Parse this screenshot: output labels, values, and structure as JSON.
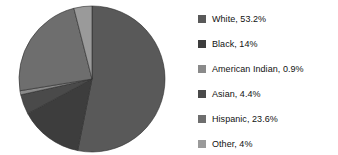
{
  "chart_data": {
    "type": "pie",
    "title": "",
    "subtitle": "",
    "xlabel": "",
    "ylabel": "",
    "grid": false,
    "legend_position": "right",
    "start_angle_deg": 0,
    "direction": "clockwise",
    "labels": [
      "White",
      "Black",
      "American Indian",
      "Asian",
      "Hispanic",
      "Other"
    ],
    "values": [
      53.2,
      14,
      0.9,
      4.4,
      23.6,
      4
    ],
    "value_text": [
      "53.2%",
      "14%",
      "0.9%",
      "4.4%",
      "23.6%",
      "4%"
    ],
    "colors": [
      "#595959",
      "#3d3d3d",
      "#8a8a8a",
      "#4a4a4a",
      "#6e6e6e",
      "#9a9a9a"
    ],
    "slice_order_clockwise": [
      "White",
      "Black",
      "Asian",
      "American Indian",
      "Hispanic",
      "Other"
    ]
  },
  "legend": {
    "items": [
      {
        "label": "White, 53.2%",
        "color": "#595959",
        "swatch_name": "legend-swatch-white"
      },
      {
        "label": "Black, 14%",
        "color": "#3d3d3d",
        "swatch_name": "legend-swatch-black"
      },
      {
        "label": "American Indian, 0.9%",
        "color": "#8a8a8a",
        "swatch_name": "legend-swatch-american-indian"
      },
      {
        "label": "Asian, 4.4%",
        "color": "#4a4a4a",
        "swatch_name": "legend-swatch-asian"
      },
      {
        "label": "Hispanic, 23.6%",
        "color": "#6e6e6e",
        "swatch_name": "legend-swatch-hispanic"
      },
      {
        "label": "Other, 4%",
        "color": "#9a9a9a",
        "swatch_name": "legend-swatch-other"
      }
    ]
  },
  "pie": {
    "center_x": 92,
    "center_y": 79,
    "radius": 73,
    "background": "#ffffff",
    "edge_color": "#2e2e2e"
  }
}
